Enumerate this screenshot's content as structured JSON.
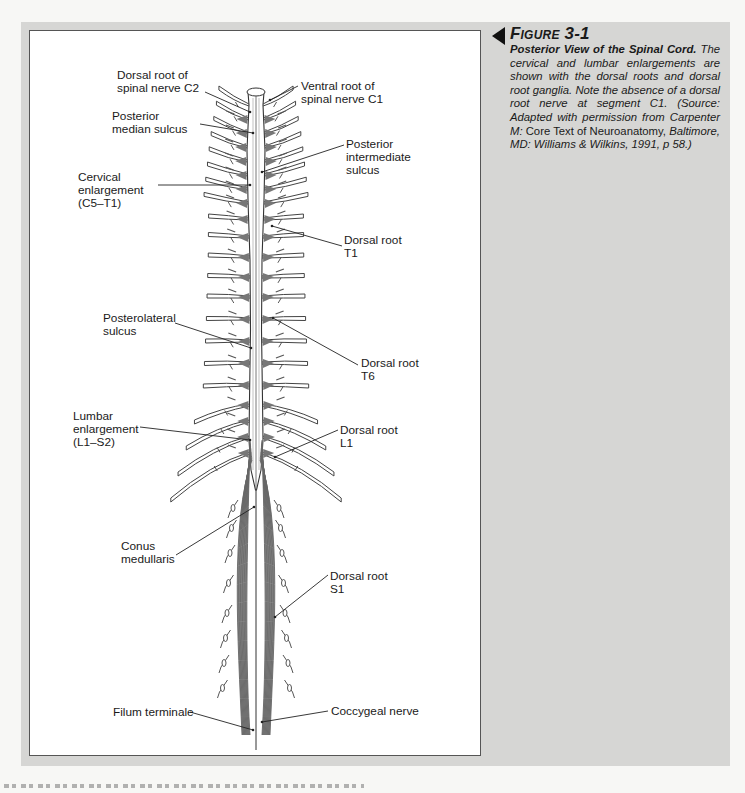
{
  "figure": {
    "number_label": "Figure 3-1",
    "title": "Posterior View of the Spinal Cord.",
    "caption_pre": "The cervical and lumbar enlargements are shown with the dorsal roots and dorsal root ganglia. Note the absence of a dorsal root nerve at segment C1. (Source: Adapted with permission from Carpenter M: ",
    "caption_book": "Core Text of Neuroanatomy,",
    "caption_post": " Baltimore, MD: Williams & Wilkins, 1991, p 58.)",
    "arrow_icon": "left-pointing-triangle"
  },
  "labels": {
    "dorsal_root_c2": "Dorsal root of\nspinal nerve C2",
    "ventral_root_c1": "Ventral root of\nspinal nerve C1",
    "posterior_median_sulcus": "Posterior\nmedian sulcus",
    "posterior_intermediate_sulcus": "Posterior\nintermediate\nsulcus",
    "cervical_enlargement": "Cervical\nenlargement\n(C5–T1)",
    "dorsal_root_t1": "Dorsal root\nT1",
    "posterolateral_sulcus": "Posterolateral\nsulcus",
    "dorsal_root_t6": "Dorsal root\nT6",
    "lumbar_enlargement": "Lumbar\nenlargement\n(L1–S2)",
    "dorsal_root_l1": "Dorsal root\nL1",
    "conus_medullaris": "Conus\nmedullaris",
    "dorsal_root_s1": "Dorsal root\nS1",
    "filum_terminale": "Filum terminale",
    "coccygeal_nerve": "Coccygeal nerve"
  },
  "colors": {
    "panel_gray": "#d6d6d4",
    "figure_bg": "#ffffff",
    "line": "#333333",
    "ganglion": "#666666"
  }
}
